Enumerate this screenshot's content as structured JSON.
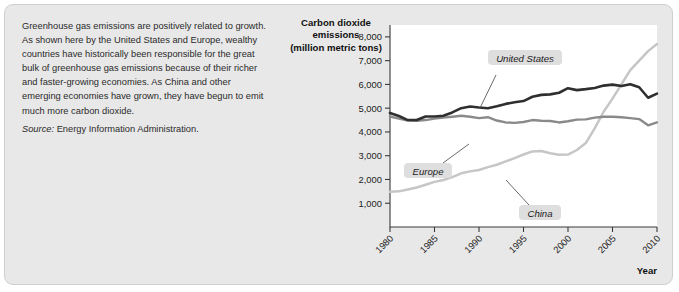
{
  "caption": {
    "body": "Greenhouse gas emissions are positively related to growth. As shown here by the United States and Europe, wealthy countries have historically been responsible for the great bulk of greenhouse gas emissions because of their richer and faster-growing economies. As China and other emerging economies have grown, they have begun to emit much more carbon dioxide.",
    "source_label": "Source:",
    "source_text": "Energy Information Administration."
  },
  "chart_data": {
    "type": "line",
    "title": "Carbon dioxide emissions (million metric tons)",
    "title_lines": [
      "Carbon dioxide",
      "emissions",
      "(million metric tons)"
    ],
    "xlabel": "Year",
    "ylabel": "Carbon dioxide emissions (million metric tons)",
    "xlim": [
      1980,
      2010
    ],
    "ylim": [
      0,
      8500
    ],
    "yticks": [
      1000,
      2000,
      3000,
      4000,
      5000,
      6000,
      7000,
      8000
    ],
    "ytick_labels": [
      "1,000",
      "2,000",
      "3,000",
      "4,000",
      "5,000",
      "6,000",
      "7,000",
      "8,000"
    ],
    "xticks": [
      1980,
      1985,
      1990,
      1995,
      2000,
      2005,
      2010
    ],
    "xtick_labels": [
      "1980",
      "1985",
      "1990",
      "1995",
      "2000",
      "2005",
      "2010"
    ],
    "grid": false,
    "legend_position": "inline-labels",
    "x": [
      1980,
      1981,
      1982,
      1983,
      1984,
      1985,
      1986,
      1987,
      1988,
      1989,
      1990,
      1991,
      1992,
      1993,
      1994,
      1995,
      1996,
      1997,
      1998,
      1999,
      2000,
      2001,
      2002,
      2003,
      2004,
      2005,
      2006,
      2007,
      2008,
      2009,
      2010
    ],
    "series": [
      {
        "name": "United States",
        "color": "#2f2f2f",
        "width": 2.6,
        "values": [
          4800,
          4670,
          4500,
          4500,
          4650,
          4650,
          4680,
          4820,
          5000,
          5070,
          5030,
          5000,
          5080,
          5180,
          5250,
          5300,
          5480,
          5560,
          5580,
          5650,
          5840,
          5760,
          5800,
          5850,
          5950,
          5990,
          5930,
          6010,
          5880,
          5440,
          5610
        ]
      },
      {
        "name": "Europe",
        "color": "#8a8a8a",
        "width": 2.4,
        "values": [
          4650,
          4560,
          4480,
          4470,
          4500,
          4560,
          4600,
          4640,
          4680,
          4640,
          4580,
          4620,
          4480,
          4400,
          4380,
          4420,
          4500,
          4470,
          4460,
          4400,
          4450,
          4520,
          4530,
          4600,
          4640,
          4640,
          4620,
          4580,
          4540,
          4280,
          4400
        ]
      },
      {
        "name": "China",
        "color": "#c6c6c6",
        "width": 2.5,
        "values": [
          1480,
          1500,
          1580,
          1660,
          1780,
          1900,
          1980,
          2100,
          2260,
          2340,
          2400,
          2520,
          2620,
          2760,
          2900,
          3050,
          3180,
          3200,
          3100,
          3040,
          3050,
          3240,
          3530,
          4150,
          4850,
          5400,
          6000,
          6600,
          7000,
          7400,
          7700
        ]
      }
    ],
    "annotations": [
      {
        "label": "United States",
        "series": "United States"
      },
      {
        "label": "Europe",
        "series": "Europe"
      },
      {
        "label": "China",
        "series": "China"
      }
    ]
  }
}
